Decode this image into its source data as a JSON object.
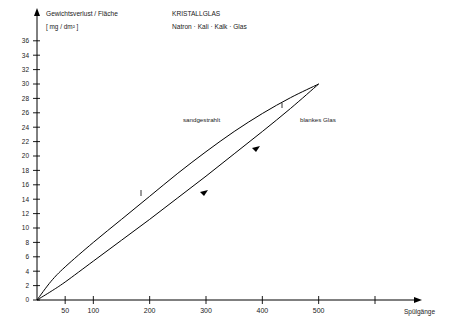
{
  "chart_data": {
    "type": "line",
    "title": "KRISTALLGLAS",
    "subtitle": "Natron · Kali · Kalk · Glas",
    "ylabel": "Gewichtsverlust / Fläche",
    "yunit": "[ mg / dm² ]",
    "xlabel": "Spülgänge",
    "xlim": [
      0,
      600
    ],
    "ylim": [
      0,
      38
    ],
    "grid": false,
    "legend_position": "inline-annotations",
    "xticks": [
      50,
      100,
      200,
      300,
      400,
      500
    ],
    "xtick_labels": [
      "50",
      "100",
      "200",
      "300",
      "400",
      "500"
    ],
    "yticks": [
      0,
      2,
      4,
      6,
      8,
      10,
      12,
      14,
      16,
      18,
      20,
      22,
      24,
      26,
      28,
      30,
      32,
      34,
      36
    ],
    "ytick_labels": [
      "0",
      "2",
      "4",
      "6",
      "8",
      "10",
      "12",
      "14",
      "16",
      "18",
      "20",
      "22",
      "24",
      "26",
      "28",
      "30",
      "32",
      "34",
      "36"
    ],
    "series": [
      {
        "name": "sandgestrahlt",
        "annotation": "sandgestrahlt",
        "x": [
          0,
          25,
          50,
          100,
          150,
          200,
          250,
          300,
          350,
          400,
          450,
          500
        ],
        "values": [
          0,
          2.6,
          4.6,
          8.0,
          11.2,
          14.4,
          17.6,
          20.6,
          23.4,
          25.9,
          28.1,
          30.0
        ]
      },
      {
        "name": "blankes Glas",
        "annotation": "blankes Glas",
        "x": [
          0,
          25,
          50,
          100,
          150,
          200,
          250,
          300,
          350,
          400,
          450,
          500
        ],
        "values": [
          0,
          1.2,
          2.5,
          5.4,
          8.3,
          11.2,
          14.2,
          17.2,
          20.3,
          23.4,
          26.6,
          30.0
        ]
      }
    ]
  },
  "labels": {
    "y_axis_title": "Gewichtsverlust / Fläche",
    "y_axis_unit": "[ mg / dm² ]",
    "x_axis_title": "Spülgänge",
    "title_main": "KRISTALLGLAS",
    "title_sub": "Natron · Kali · Kalk · Glas",
    "series_upper": "sandgestrahlt",
    "series_lower": "blankes Glas"
  }
}
